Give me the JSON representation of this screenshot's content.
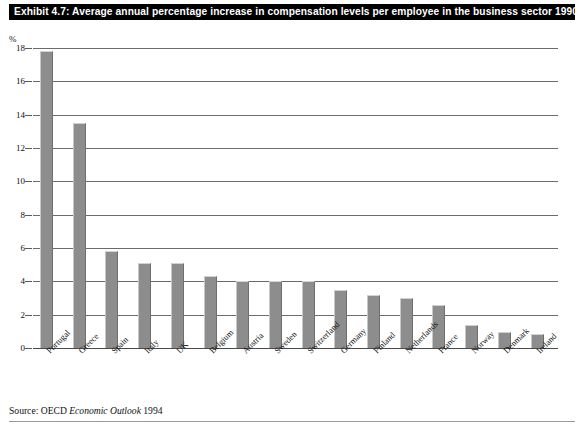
{
  "title": "Exhibit 4.7: Average annual percentage increase in compensation levels per employee in the business sector 1990-93",
  "yaxis_unit": "%",
  "source": {
    "prefix": "Source: OECD ",
    "emphasis": "Economic Outlook",
    "suffix": " 1994"
  },
  "colors": {
    "title_bar_background": "#000000",
    "title_bar_text": "#ffffff",
    "bar_fill": "#8d8d8d",
    "bar_highlight": "#c8c8c8",
    "bar_shadow": "#6e6e6e",
    "gridline": "#6b6b6b",
    "text": "#111111",
    "page_background": "#ffffff"
  },
  "chart_data": {
    "type": "bar",
    "title": "Exhibit 4.7: Average annual percentage increase in compensation levels per employee in the business sector 1990-93",
    "xlabel": "",
    "ylabel": "%",
    "ylim": [
      0,
      18
    ],
    "yticks": [
      0,
      2,
      4,
      6,
      8,
      10,
      12,
      14,
      16,
      18
    ],
    "ytick_labels": [
      "0",
      "2",
      "4",
      "6",
      "8",
      "10",
      "12",
      "14",
      "16",
      "18"
    ],
    "grid": true,
    "legend": false,
    "orientation": "vertical",
    "categories": [
      "Portugal",
      "Greece",
      "Spain",
      "Italy",
      "UK",
      "Belgium",
      "Austria",
      "Sweden",
      "Switzerland",
      "Germany",
      "Finland",
      "Netherlands",
      "France",
      "Norway",
      "Denmark",
      "Ireland"
    ],
    "values": [
      17.8,
      13.5,
      5.8,
      5.1,
      5.1,
      4.3,
      4.0,
      4.0,
      4.0,
      3.5,
      3.2,
      3.0,
      2.6,
      1.4,
      0.95,
      0.85
    ]
  }
}
